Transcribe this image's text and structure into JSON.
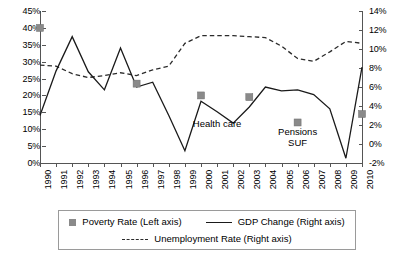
{
  "chart_data": {
    "type": "line",
    "title": "",
    "xlabel": "",
    "ylabel": "",
    "grid": false,
    "legend_position": "bottom",
    "categories": [
      1990,
      1991,
      1992,
      1993,
      1994,
      1995,
      1996,
      1997,
      1998,
      1999,
      2000,
      2001,
      2002,
      2003,
      2004,
      2005,
      2006,
      2007,
      2008,
      2009,
      2010
    ],
    "left_axis": {
      "label": "Poverty Rate (Left axis)",
      "ylim": [
        0,
        45
      ],
      "ticks": [
        "0%",
        "5%",
        "10%",
        "15%",
        "20%",
        "25%",
        "30%",
        "35%",
        "40%",
        "45%"
      ],
      "tick_values": [
        0,
        5,
        10,
        15,
        20,
        25,
        30,
        35,
        40,
        45
      ]
    },
    "right_axis": {
      "label": "GDP Change / Unemployment Rate (Right axis)",
      "ylim": [
        -2,
        14
      ],
      "ticks": [
        "-2%",
        "0%",
        "2%",
        "4%",
        "6%",
        "8%",
        "10%",
        "12%",
        "14%"
      ],
      "tick_values": [
        -2,
        0,
        2,
        4,
        6,
        8,
        10,
        12,
        14
      ]
    },
    "series": [
      {
        "name": "Poverty Rate (Left axis)",
        "axis": "left",
        "type": "scatter",
        "marker": "square",
        "color": "#8a8a8a",
        "points": [
          {
            "x": 1990,
            "y": 40.0
          },
          {
            "x": 1996,
            "y": 23.5
          },
          {
            "x": 2000,
            "y": 20.0
          },
          {
            "x": 2003,
            "y": 19.5
          },
          {
            "x": 2006,
            "y": 12.0
          },
          {
            "x": 2010,
            "y": 14.5
          }
        ]
      },
      {
        "name": "GDP Change (Right axis)",
        "axis": "right",
        "type": "line",
        "style": "solid",
        "color": "#1a1a1a",
        "values": [
          3.0,
          7.7,
          11.3,
          7.6,
          5.7,
          10.1,
          6.0,
          6.5,
          3.0,
          -0.7,
          4.5,
          3.4,
          2.2,
          3.9,
          6.0,
          5.6,
          5.7,
          5.2,
          3.7,
          -1.5,
          8.1
        ]
      },
      {
        "name": "Unemployment Rate (Right axis)",
        "axis": "right",
        "type": "line",
        "style": "dashed",
        "color": "#2b2b2b",
        "values": [
          8.3,
          8.2,
          7.4,
          7.0,
          7.2,
          7.5,
          7.2,
          7.8,
          8.2,
          10.6,
          11.4,
          11.4,
          11.4,
          11.3,
          11.2,
          10.3,
          9.0,
          8.7,
          9.7,
          10.8,
          10.6
        ]
      }
    ],
    "annotations": [
      {
        "text": "Health care",
        "x": 2001,
        "y_right": 2.2
      },
      {
        "text": "Pensions",
        "x": 2006,
        "y_right": 1.4
      },
      {
        "text": "SUF",
        "x": 2006,
        "y_right": 0.2
      }
    ]
  },
  "annotations": {
    "health_care": "Health care",
    "pensions": "Pensions",
    "suf": "SUF"
  },
  "legend": {
    "poverty": "Poverty Rate (Left axis)",
    "gdp": "GDP Change (Right axis)",
    "unemployment": "Unemployment Rate (Right axis)"
  }
}
